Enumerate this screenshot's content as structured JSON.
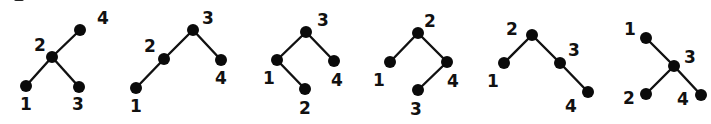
{
  "diagram": {
    "node_radius": 6,
    "colors": {
      "node": "#0a0a0a",
      "edge": "#111111",
      "label": "#111111",
      "background": "#ffffff"
    },
    "trees": [
      {
        "id": "tree-1",
        "nodes": [
          {
            "key": "4",
            "x": 80,
            "y": 30,
            "lx": 97,
            "ly": 24
          },
          {
            "key": "2",
            "x": 52,
            "y": 57,
            "lx": 34,
            "ly": 51
          },
          {
            "key": "1",
            "x": 26,
            "y": 86,
            "lx": 20,
            "ly": 110
          },
          {
            "key": "3",
            "x": 79,
            "y": 87,
            "lx": 72,
            "ly": 110
          }
        ],
        "edges": [
          [
            "2",
            "4"
          ],
          [
            "2",
            "1"
          ],
          [
            "2",
            "3"
          ]
        ]
      },
      {
        "id": "tree-2",
        "nodes": [
          {
            "key": "3",
            "x": 193,
            "y": 30,
            "lx": 202,
            "ly": 24
          },
          {
            "key": "2",
            "x": 164,
            "y": 59,
            "lx": 144,
            "ly": 52
          },
          {
            "key": "1",
            "x": 136,
            "y": 88,
            "lx": 130,
            "ly": 112
          },
          {
            "key": "4",
            "x": 221,
            "y": 60,
            "lx": 215,
            "ly": 84
          }
        ],
        "edges": [
          [
            "3",
            "2"
          ],
          [
            "2",
            "1"
          ],
          [
            "3",
            "4"
          ]
        ]
      },
      {
        "id": "tree-3",
        "nodes": [
          {
            "key": "3",
            "x": 306,
            "y": 32,
            "lx": 317,
            "ly": 26
          },
          {
            "key": "1",
            "x": 277,
            "y": 60,
            "lx": 263,
            "ly": 84
          },
          {
            "key": "2",
            "x": 305,
            "y": 89,
            "lx": 299,
            "ly": 114
          },
          {
            "key": "4",
            "x": 334,
            "y": 61,
            "lx": 331,
            "ly": 86
          }
        ],
        "edges": [
          [
            "3",
            "1"
          ],
          [
            "1",
            "2"
          ],
          [
            "3",
            "4"
          ]
        ]
      },
      {
        "id": "tree-4",
        "nodes": [
          {
            "key": "2",
            "x": 418,
            "y": 33,
            "lx": 424,
            "ly": 27
          },
          {
            "key": "1",
            "x": 390,
            "y": 62,
            "lx": 373,
            "ly": 86
          },
          {
            "key": "4",
            "x": 447,
            "y": 62,
            "lx": 447,
            "ly": 87
          },
          {
            "key": "3",
            "x": 418,
            "y": 90,
            "lx": 410,
            "ly": 115
          }
        ],
        "edges": [
          [
            "2",
            "1"
          ],
          [
            "2",
            "4"
          ],
          [
            "4",
            "3"
          ]
        ]
      },
      {
        "id": "tree-5",
        "nodes": [
          {
            "key": "2",
            "x": 532,
            "y": 35,
            "lx": 506,
            "ly": 35
          },
          {
            "key": "1",
            "x": 504,
            "y": 63,
            "lx": 487,
            "ly": 87
          },
          {
            "key": "3",
            "x": 560,
            "y": 63,
            "lx": 568,
            "ly": 56
          },
          {
            "key": "4",
            "x": 588,
            "y": 92,
            "lx": 565,
            "ly": 112
          }
        ],
        "edges": [
          [
            "2",
            "1"
          ],
          [
            "2",
            "3"
          ],
          [
            "3",
            "4"
          ]
        ]
      },
      {
        "id": "tree-6",
        "nodes": [
          {
            "key": "1",
            "x": 646,
            "y": 38,
            "lx": 624,
            "ly": 35
          },
          {
            "key": "3",
            "x": 674,
            "y": 66,
            "lx": 684,
            "ly": 63
          },
          {
            "key": "2",
            "x": 646,
            "y": 94,
            "lx": 623,
            "ly": 104
          },
          {
            "key": "4",
            "x": 701,
            "y": 95,
            "lx": 677,
            "ly": 105
          }
        ],
        "edges": [
          [
            "3",
            "1"
          ],
          [
            "3",
            "2"
          ],
          [
            "3",
            "4"
          ]
        ]
      }
    ]
  }
}
